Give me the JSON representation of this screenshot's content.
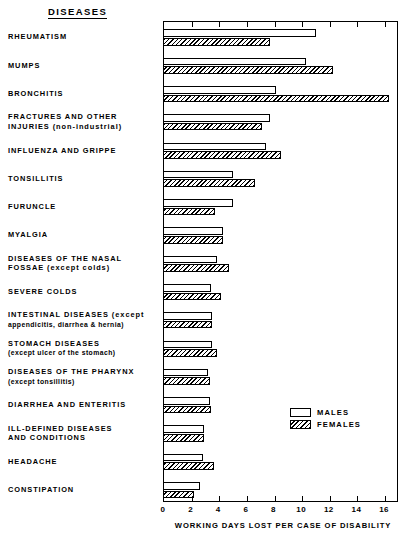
{
  "header": {
    "column_header": "DISEASES"
  },
  "chart_data": {
    "type": "bar",
    "orientation": "horizontal",
    "title": "",
    "xlabel": "WORKING DAYS LOST PER CASE OF DISABILITY",
    "ylabel": "DISEASES",
    "xlim": [
      0,
      17
    ],
    "xticks": [
      0,
      2,
      4,
      6,
      8,
      10,
      12,
      14,
      16
    ],
    "xtick_labels": [
      "0",
      "2",
      "4",
      "6",
      "8",
      "10",
      "12",
      "14",
      "16"
    ],
    "grid": false,
    "legend_position": "inside-right-lower",
    "categories": [
      "RHEUMATISM",
      "MUMPS",
      "BRONCHITIS",
      "FRACTURES AND OTHER INJURIES (non-industrial)",
      "INFLUENZA AND GRIPPE",
      "TONSILLITIS",
      "FURUNCLE",
      "MYALGIA",
      "DISEASES OF THE NASAL FOSSAE (except colds)",
      "SEVERE COLDS",
      "INTESTINAL DISEASES (except appendicitis, diarrhea & hernia)",
      "STOMACH DISEASES (except ulcer of the stomach)",
      "DISEASES OF THE PHARYNX (except tonsillitis)",
      "DIARRHEA AND ENTERITIS",
      "ILL-DEFINED DISEASES AND CONDITIONS",
      "HEADACHE",
      "CONSTIPATION"
    ],
    "series": [
      {
        "name": "MALES",
        "values": [
          11.0,
          10.3,
          8.1,
          7.7,
          7.4,
          5.0,
          5.0,
          4.3,
          3.8,
          3.4,
          3.5,
          3.5,
          3.2,
          3.3,
          2.9,
          2.8,
          2.6
        ]
      },
      {
        "name": "FEMALES",
        "values": [
          7.7,
          12.2,
          16.3,
          7.1,
          8.5,
          6.6,
          3.7,
          4.3,
          4.7,
          4.1,
          3.5,
          3.8,
          3.3,
          3.4,
          2.9,
          3.6,
          2.2
        ]
      }
    ]
  },
  "labels": [
    {
      "lines": [
        {
          "text": "RHEUMATISM",
          "style": "main"
        }
      ]
    },
    {
      "lines": [
        {
          "text": "MUMPS",
          "style": "main"
        }
      ]
    },
    {
      "lines": [
        {
          "text": "BRONCHITIS",
          "style": "main"
        }
      ]
    },
    {
      "lines": [
        {
          "text": "FRACTURES AND OTHER",
          "style": "main"
        },
        {
          "text": "INJURIES (non-industrial)",
          "style": "main"
        }
      ]
    },
    {
      "lines": [
        {
          "text": "INFLUENZA AND GRIPPE",
          "style": "main"
        }
      ]
    },
    {
      "lines": [
        {
          "text": "TONSILLITIS",
          "style": "main"
        }
      ]
    },
    {
      "lines": [
        {
          "text": "FURUNCLE",
          "style": "main"
        }
      ]
    },
    {
      "lines": [
        {
          "text": "MYALGIA",
          "style": "main"
        }
      ]
    },
    {
      "lines": [
        {
          "text": "DISEASES OF THE NASAL",
          "style": "main"
        },
        {
          "text": "FOSSAE (except colds)",
          "style": "main"
        }
      ]
    },
    {
      "lines": [
        {
          "text": "SEVERE COLDS",
          "style": "main"
        }
      ]
    },
    {
      "lines": [
        {
          "text": "INTESTINAL DISEASES (except",
          "style": "main"
        },
        {
          "text": "appendicitis, diarrhea & hernia)",
          "style": "sub"
        }
      ]
    },
    {
      "lines": [
        {
          "text": "STOMACH DISEASES",
          "style": "main"
        },
        {
          "text": "(except ulcer of the stomach)",
          "style": "sub"
        }
      ]
    },
    {
      "lines": [
        {
          "text": "DISEASES OF THE PHARYNX",
          "style": "main"
        },
        {
          "text": "(except tonsillitis)",
          "style": "sub"
        }
      ]
    },
    {
      "lines": [
        {
          "text": "DIARRHEA AND ENTERITIS",
          "style": "main"
        }
      ]
    },
    {
      "lines": [
        {
          "text": "ILL-DEFINED DISEASES",
          "style": "main"
        },
        {
          "text": "AND CONDITIONS",
          "style": "main"
        }
      ]
    },
    {
      "lines": [
        {
          "text": "HEADACHE",
          "style": "main"
        }
      ]
    },
    {
      "lines": [
        {
          "text": "CONSTIPATION",
          "style": "main"
        }
      ]
    }
  ],
  "legend": {
    "items": [
      {
        "label": "MALES",
        "swatch": "open-white"
      },
      {
        "label": "FEMALES",
        "swatch": "hatched-diagonal"
      }
    ]
  },
  "colors": {
    "ink": "#000000",
    "paper": "#ffffff"
  }
}
